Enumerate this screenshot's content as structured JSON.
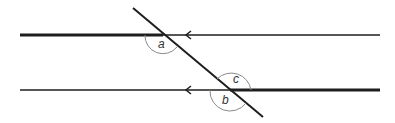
{
  "diagram": {
    "type": "parallel-lines-transversal",
    "colors": {
      "line": "#1e1e1e",
      "arc": "#8a8a8a",
      "label": "#333333",
      "background": "#ffffff"
    },
    "angles": [
      {
        "id": "a",
        "label": "a",
        "position": "below top intersection, left side"
      },
      {
        "id": "c",
        "label": "c",
        "position": "above bottom intersection, right side"
      },
      {
        "id": "b",
        "label": "b",
        "position": "below bottom intersection"
      }
    ],
    "lines": {
      "top": {
        "arrow_direction": "left"
      },
      "bottom": {
        "arrow_direction": "left"
      },
      "transversal": {}
    }
  }
}
